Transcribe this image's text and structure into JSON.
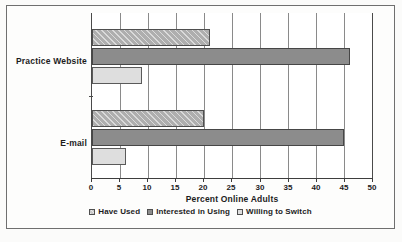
{
  "chart_data": {
    "type": "bar",
    "orientation": "horizontal",
    "title": "",
    "xlabel": "Percent Online Adults",
    "ylabel": "",
    "xlim": [
      0,
      50
    ],
    "xticks": [
      0,
      5,
      10,
      15,
      20,
      25,
      30,
      35,
      40,
      45,
      50
    ],
    "xticklabels": [
      "0",
      "5",
      "10",
      "15",
      "20",
      "25",
      "30",
      "35",
      "40",
      "45",
      "50"
    ],
    "grid": "vertical",
    "legend_position": "bottom-center",
    "categories": [
      "Practice Website",
      "E-mail"
    ],
    "series": [
      {
        "name": "Have Used",
        "values": [
          21,
          20
        ],
        "color": "#aeaeae",
        "pattern": "diagonal-hatch"
      },
      {
        "name": "Interested in Using",
        "values": [
          46,
          45
        ],
        "color": "#8c8c8c",
        "pattern": "solid"
      },
      {
        "name": "Willing to Switch",
        "values": [
          9,
          6
        ],
        "color": "#dedede",
        "pattern": "solid"
      }
    ]
  }
}
